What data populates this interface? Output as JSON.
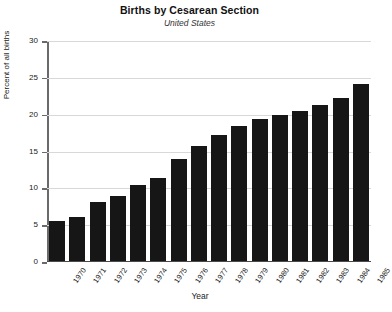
{
  "chart_data": {
    "type": "bar",
    "title": "Births by Cesarean Section",
    "subtitle": "United States",
    "xlabel": "Year",
    "ylabel": "Percent of all births",
    "categories": [
      "1970",
      "1971",
      "1972",
      "1973",
      "1974",
      "1975",
      "1976",
      "1977",
      "1978",
      "1979",
      "1980",
      "1981",
      "1982",
      "1983",
      "1984",
      "1985"
    ],
    "values": [
      5.5,
      6.1,
      8.1,
      9.0,
      10.4,
      11.4,
      14.0,
      15.7,
      17.3,
      18.5,
      19.4,
      20.0,
      20.5,
      21.3,
      22.3,
      24.1
    ],
    "ylim": [
      0,
      30
    ],
    "yticks": [
      0,
      5,
      10,
      15,
      20,
      25,
      30
    ],
    "ytick_labels": [
      "0",
      "5",
      "10",
      "15",
      "20",
      "25",
      "30"
    ],
    "grid": true,
    "legend": false,
    "bar_color": "#161616",
    "grid_color": "#d8d8d8",
    "axis_color": "#6a6a6a"
  }
}
